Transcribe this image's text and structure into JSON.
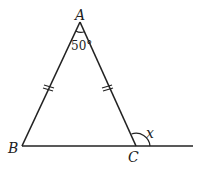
{
  "diagram": {
    "type": "isosceles-triangle-exterior-angle",
    "vertices": {
      "A": {
        "label": "A",
        "x": 80,
        "y": 22
      },
      "B": {
        "label": "B",
        "x": 22,
        "y": 146
      },
      "C": {
        "label": "C",
        "x": 136,
        "y": 146
      }
    },
    "extension_end": {
      "x": 193,
      "y": 146
    },
    "apex_angle": {
      "label": "50°",
      "value": 50
    },
    "exterior_angle": {
      "label": "x"
    },
    "equal_sides": [
      "AB",
      "AC"
    ],
    "stroke_color": "#222222"
  }
}
